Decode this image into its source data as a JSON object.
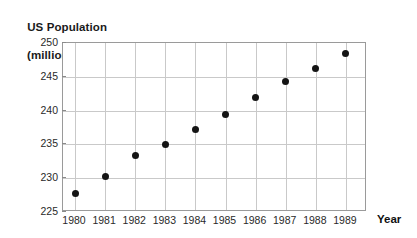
{
  "chart_data": {
    "type": "scatter",
    "title": "US Population",
    "title_line1": "US Population",
    "title_line2": "(millions)",
    "subtitle": "(millions)",
    "xlabel": "Year",
    "ylabel": "",
    "x": [
      1980,
      1981,
      1982,
      1983,
      1984,
      1985,
      1986,
      1987,
      1988,
      1989
    ],
    "values": [
      227.8,
      230.2,
      233.3,
      235.0,
      237.2,
      239.4,
      242.0,
      244.3,
      246.3,
      248.5
    ],
    "categories": [
      "1980",
      "1981",
      "1982",
      "1983",
      "1984",
      "1985",
      "1986",
      "1987",
      "1988",
      "1989"
    ],
    "xticklabels": [
      "1980",
      "1981",
      "1982",
      "1983",
      "1984",
      "1985",
      "1986",
      "1987",
      "1988",
      "1989"
    ],
    "yticklabels": [
      "250",
      "245",
      "240",
      "235",
      "230",
      "225"
    ],
    "yticks": [
      250,
      245,
      240,
      235,
      230,
      225
    ],
    "ylim": [
      225,
      250
    ],
    "xlim": [
      1979.6,
      1989.7
    ],
    "grid": true,
    "legend": false,
    "marker_color": "#141414",
    "grid_color": "#c9c9c9",
    "frame_color": "#9a9a9a"
  }
}
